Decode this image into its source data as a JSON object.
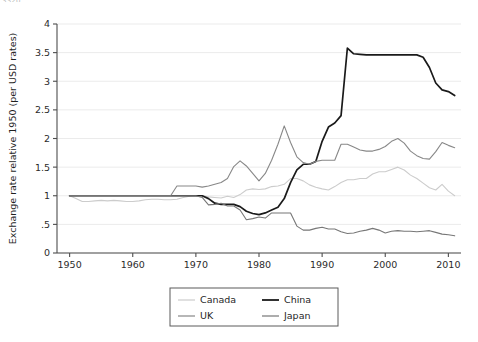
{
  "top_cut_text": "3320",
  "chart_data": {
    "type": "line",
    "title": "",
    "xlabel": "",
    "ylabel": "Exchange rate relative 1950 (per USD rates)",
    "xlim": [
      1948,
      2012
    ],
    "ylim": [
      0,
      4
    ],
    "xticks": [
      "1950",
      "1960",
      "1970",
      "1980",
      "1990",
      "2000",
      "2010"
    ],
    "xtick_values": [
      1950,
      1960,
      1970,
      1980,
      1990,
      2000,
      2010
    ],
    "yticks": [
      "0",
      ".5",
      "1",
      "1.5",
      "2",
      "2.5",
      "3",
      "3.5",
      "4"
    ],
    "ytick_values": [
      0,
      0.5,
      1,
      1.5,
      2,
      2.5,
      3,
      3.5,
      4
    ],
    "grid": "horizontal",
    "legend_position": "bottom-center",
    "legend_entries": [
      "Canada",
      "China",
      "UK",
      "Japan"
    ],
    "colors": {
      "Canada": "#cccccc",
      "China": "#1a1a1a",
      "UK": "#888888",
      "Japan": "#777777",
      "grid": "#ebebeb",
      "axis": "#4d4d4d",
      "text": "#1f1f1f"
    },
    "series": [
      {
        "name": "Canada",
        "color": "#cccccc",
        "x": [
          1950,
          1951,
          1952,
          1953,
          1954,
          1955,
          1956,
          1957,
          1958,
          1959,
          1960,
          1961,
          1962,
          1963,
          1964,
          1965,
          1966,
          1967,
          1968,
          1969,
          1970,
          1971,
          1972,
          1973,
          1974,
          1975,
          1976,
          1977,
          1978,
          1979,
          1980,
          1981,
          1982,
          1983,
          1984,
          1985,
          1986,
          1987,
          1988,
          1989,
          1990,
          1991,
          1992,
          1993,
          1994,
          1995,
          1996,
          1997,
          1998,
          1999,
          2000,
          2001,
          2002,
          2003,
          2004,
          2005,
          2006,
          2007,
          2008,
          2009,
          2010,
          2011
        ],
        "values": [
          1.0,
          0.95,
          0.9,
          0.9,
          0.91,
          0.92,
          0.91,
          0.92,
          0.91,
          0.9,
          0.9,
          0.91,
          0.93,
          0.94,
          0.94,
          0.93,
          0.93,
          0.94,
          0.97,
          0.99,
          1.0,
          1.0,
          0.98,
          0.97,
          0.96,
          0.99,
          0.97,
          1.02,
          1.1,
          1.12,
          1.11,
          1.12,
          1.16,
          1.17,
          1.2,
          1.3,
          1.3,
          1.26,
          1.19,
          1.15,
          1.12,
          1.1,
          1.16,
          1.23,
          1.28,
          1.28,
          1.3,
          1.3,
          1.38,
          1.42,
          1.42,
          1.46,
          1.5,
          1.45,
          1.36,
          1.3,
          1.22,
          1.14,
          1.1,
          1.2,
          1.08,
          1.0
        ]
      },
      {
        "name": "China",
        "color": "#1a1a1a",
        "x": [
          1950,
          1955,
          1960,
          1965,
          1967,
          1968,
          1969,
          1970,
          1971,
          1972,
          1973,
          1974,
          1975,
          1976,
          1977,
          1978,
          1979,
          1980,
          1981,
          1982,
          1983,
          1984,
          1985,
          1986,
          1987,
          1988,
          1989,
          1990,
          1991,
          1992,
          1993,
          1994,
          1995,
          1996,
          1997,
          1998,
          1999,
          2000,
          2001,
          2002,
          2003,
          2004,
          2005,
          2006,
          2007,
          2008,
          2009,
          2010,
          2011
        ],
        "values": [
          1.0,
          1.0,
          1.0,
          1.0,
          1.0,
          1.0,
          1.0,
          1.0,
          1.0,
          0.95,
          0.87,
          0.85,
          0.85,
          0.85,
          0.81,
          0.73,
          0.69,
          0.67,
          0.7,
          0.75,
          0.8,
          0.95,
          1.23,
          1.45,
          1.55,
          1.55,
          1.6,
          1.95,
          2.2,
          2.27,
          2.4,
          3.58,
          3.48,
          3.47,
          3.46,
          3.46,
          3.46,
          3.46,
          3.46,
          3.46,
          3.46,
          3.46,
          3.46,
          3.42,
          3.24,
          2.97,
          2.85,
          2.82,
          2.75
        ]
      },
      {
        "name": "UK",
        "color": "#888888",
        "x": [
          1950,
          1951,
          1952,
          1953,
          1954,
          1955,
          1956,
          1957,
          1958,
          1959,
          1960,
          1961,
          1962,
          1963,
          1964,
          1965,
          1966,
          1967,
          1968,
          1969,
          1970,
          1971,
          1972,
          1973,
          1974,
          1975,
          1976,
          1977,
          1978,
          1979,
          1980,
          1981,
          1982,
          1983,
          1984,
          1985,
          1986,
          1987,
          1988,
          1989,
          1990,
          1991,
          1992,
          1993,
          1994,
          1995,
          1996,
          1997,
          1998,
          1999,
          2000,
          2001,
          2002,
          2003,
          2004,
          2005,
          2006,
          2007,
          2008,
          2009,
          2010,
          2011
        ],
        "values": [
          1.0,
          1.0,
          1.0,
          1.0,
          1.0,
          1.0,
          1.0,
          1.0,
          1.0,
          1.0,
          1.0,
          1.0,
          1.0,
          1.0,
          1.0,
          1.0,
          1.0,
          1.17,
          1.17,
          1.17,
          1.17,
          1.15,
          1.17,
          1.2,
          1.23,
          1.3,
          1.51,
          1.61,
          1.52,
          1.39,
          1.26,
          1.39,
          1.62,
          1.9,
          2.22,
          1.93,
          1.68,
          1.58,
          1.55,
          1.6,
          1.62,
          1.62,
          1.62,
          1.9,
          1.9,
          1.85,
          1.8,
          1.78,
          1.78,
          1.81,
          1.86,
          1.95,
          2.0,
          1.92,
          1.78,
          1.7,
          1.65,
          1.64,
          1.77,
          1.93,
          1.88,
          1.84
        ]
      },
      {
        "name": "Japan",
        "color": "#777777",
        "x": [
          1950,
          1955,
          1960,
          1965,
          1970,
          1971,
          1972,
          1973,
          1974,
          1975,
          1976,
          1977,
          1978,
          1979,
          1980,
          1981,
          1982,
          1983,
          1984,
          1985,
          1986,
          1987,
          1988,
          1989,
          1990,
          1991,
          1992,
          1993,
          1994,
          1995,
          1996,
          1997,
          1998,
          1999,
          2000,
          2001,
          2002,
          2003,
          2004,
          2005,
          2006,
          2007,
          2008,
          2009,
          2010,
          2011
        ],
        "values": [
          1.0,
          1.0,
          1.0,
          1.0,
          1.0,
          0.97,
          0.84,
          0.85,
          0.87,
          0.82,
          0.82,
          0.75,
          0.58,
          0.6,
          0.63,
          0.61,
          0.7,
          0.7,
          0.7,
          0.7,
          0.47,
          0.4,
          0.4,
          0.43,
          0.45,
          0.42,
          0.42,
          0.37,
          0.34,
          0.35,
          0.38,
          0.4,
          0.43,
          0.4,
          0.35,
          0.38,
          0.39,
          0.38,
          0.38,
          0.37,
          0.38,
          0.39,
          0.36,
          0.33,
          0.32,
          0.3
        ]
      }
    ]
  }
}
